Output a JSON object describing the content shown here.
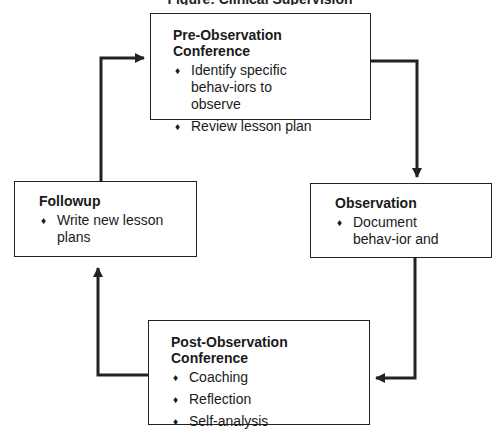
{
  "diagram": {
    "title_fragment": "Figure: Clinical Supervision Cycle",
    "boxes": {
      "pre_observation": {
        "title": "Pre-Observation Conference",
        "items": [
          "Identify specific behav-iors to observe",
          "Review lesson plan"
        ]
      },
      "observation": {
        "title": "Observation",
        "items": [
          "Document behav-ior and"
        ]
      },
      "post_observation": {
        "title": "Post-Observation Conference",
        "items": [
          "Coaching",
          "Reflection",
          "Self-analysis"
        ]
      },
      "followup": {
        "title": "Followup",
        "items": [
          "Write new lesson plans"
        ]
      }
    },
    "flow": [
      "Pre-Observation Conference",
      "Observation",
      "Post-Observation Conference",
      "Followup"
    ],
    "colors": {
      "stroke": "#222222",
      "background": "#ffffff"
    }
  }
}
